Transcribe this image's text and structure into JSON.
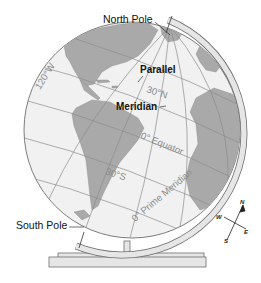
{
  "figure": {
    "colors": {
      "ocean": "#f1f1f1",
      "land": "#a9a9a9",
      "grid_lines": "#8c8c8c",
      "stand": "#e6e6e6",
      "stand_outline": "#6e6e6e",
      "callout_text": "#111111",
      "globe_text": "#8a8a8a"
    }
  },
  "callouts": {
    "north_pole": "North Pole",
    "south_pole": "South Pole",
    "parallel": "Parallel",
    "meridian": "Meridian"
  },
  "grid_labels": {
    "lon_120w": "120°W",
    "lat_30n": "30°N",
    "equator": "0° Equator",
    "lat_30s": "30°S",
    "prime_meridian": "0° Prime Meridian"
  },
  "compass": {
    "n": "N",
    "s": "S",
    "e": "E",
    "w": "W"
  }
}
